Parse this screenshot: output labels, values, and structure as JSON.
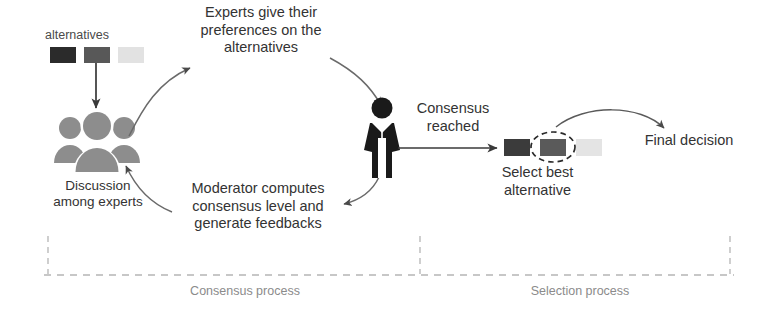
{
  "diagram": {
    "labels": {
      "alternatives": "alternatives",
      "experts_preferences": "Experts give their\npreferences on the\nalternatives",
      "moderator_computes": "Moderator computes\nconsensus level and\ngenerate feedbacks",
      "discussion_among_experts": "Discussion\namong experts",
      "consensus_reached": "Consensus\nreached",
      "select_best_alternative": "Select best\nalternative",
      "final_decision": "Final decision",
      "consensus_process": "Consensus process",
      "selection_process": "Selection process"
    },
    "icons": {
      "group_of_experts": "group-of-people-icon",
      "moderator": "person-icon",
      "selected_marker": "dashed-ellipse-icon"
    },
    "alternatives_top": [
      {
        "name": "alternative-1",
        "shade": "#2b2b2b"
      },
      {
        "name": "alternative-2",
        "shade": "#585858"
      },
      {
        "name": "alternative-3",
        "shade": "#e2e2e2"
      }
    ],
    "alternatives_selection": [
      {
        "name": "alternative-1",
        "shade": "#3b3b3b",
        "selected": false
      },
      {
        "name": "alternative-2",
        "shade": "#5a5a5a",
        "selected": true
      },
      {
        "name": "alternative-3",
        "shade": "#e4e4e4",
        "selected": false
      }
    ],
    "colors": {
      "stroke": "#4a4a4a",
      "group_icon": "#8d8d8d",
      "moderator_icon": "#1a1a1a",
      "phase_divider": "#b5b5b5",
      "text": "#333333",
      "phase_text": "#8b8b8b",
      "background": "#ffffff"
    }
  }
}
